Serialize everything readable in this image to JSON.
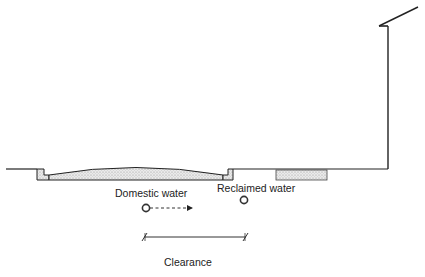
{
  "diagram": {
    "type": "street cross-section (utility clearance)",
    "labels": {
      "domestic_water": "Domestic water",
      "reclaimed_water": "Reclaimed water",
      "clearance": "Clearance"
    },
    "elements": [
      {
        "name": "ground-line",
        "description": "Grade line from left edge to building wall"
      },
      {
        "name": "left-curb",
        "description": "Stippled curb at left edge of roadway"
      },
      {
        "name": "roadway",
        "description": "Crowned stippled pavement section"
      },
      {
        "name": "right-curb",
        "description": "Stippled curb at right edge of roadway"
      },
      {
        "name": "sidewalk-vault",
        "description": "Stippled rectangular slab beneath sidewalk"
      },
      {
        "name": "building-wall",
        "description": "Vertical building wall with sloped roof line"
      },
      {
        "name": "domestic-water-pipe",
        "description": "Pipe symbol with dashed arrow pointing right"
      },
      {
        "name": "reclaimed-water-pipe",
        "description": "Pipe symbol"
      },
      {
        "name": "clearance-dimension",
        "description": "Horizontal dimension line with tick marks"
      }
    ],
    "colors": {
      "line": "#222222",
      "stipple": "#d8d8d8"
    }
  }
}
